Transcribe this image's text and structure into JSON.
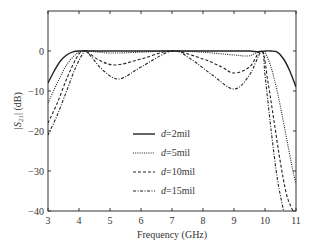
{
  "chart_data": {
    "type": "line",
    "title": "",
    "xlabel": "Frequency (GHz)",
    "ylabel": "|S21| (dB)",
    "xlim": [
      3,
      11
    ],
    "ylim": [
      -40,
      10
    ],
    "xticks": [
      3,
      4,
      5,
      6,
      7,
      8,
      9,
      10,
      11
    ],
    "yticks": [
      0,
      -10,
      -20,
      -30,
      -40
    ],
    "grid": false,
    "legend_position": "center-right inside",
    "series": [
      {
        "name": "d=2mil",
        "style": "solid",
        "x": [
          3.0,
          3.2,
          3.4,
          3.6,
          3.8,
          4.0,
          4.5,
          5,
          6,
          7,
          8,
          9,
          9.5,
          9.8,
          10.0,
          10.2,
          10.4,
          10.6,
          10.8,
          11.0
        ],
        "y": [
          -8,
          -5,
          -2.5,
          -1,
          -0.2,
          0,
          0,
          0,
          0,
          0,
          0,
          0,
          0,
          -0.2,
          0,
          0,
          -0.3,
          -2,
          -5,
          -9
        ]
      },
      {
        "name": "d=5mil",
        "style": "dotted",
        "x": [
          3.0,
          3.3,
          3.6,
          3.9,
          4.1,
          4.3,
          5,
          6,
          7,
          8,
          9,
          9.5,
          9.9,
          10.1,
          10.3,
          10.5,
          10.7,
          10.9,
          11.0
        ],
        "y": [
          -13,
          -8,
          -3.5,
          -0.8,
          0,
          0,
          -0.5,
          -0.3,
          0,
          -0.3,
          -1,
          -1.2,
          0,
          -2,
          -7,
          -14,
          -22,
          -30,
          -33
        ]
      },
      {
        "name": "d=10mil",
        "style": "dashed",
        "x": [
          3.0,
          3.3,
          3.6,
          3.9,
          4.1,
          4.3,
          4.7,
          5.2,
          6,
          7,
          8,
          8.6,
          9.0,
          9.5,
          9.9,
          10.1,
          10.3,
          10.5,
          10.7,
          10.9
        ],
        "y": [
          -18,
          -13,
          -7,
          -2,
          0,
          -0.5,
          -2.5,
          -3.5,
          -2,
          0,
          -2,
          -4,
          -5.5,
          -4,
          0,
          -8,
          -18,
          -28,
          -36,
          -40
        ]
      },
      {
        "name": "d=15mil",
        "style": "dash-dot",
        "x": [
          3.0,
          3.3,
          3.6,
          3.9,
          4.2,
          4.4,
          4.8,
          5.3,
          6,
          7,
          7.6,
          8.3,
          9.0,
          9.5,
          9.9,
          10.0,
          10.2,
          10.4,
          10.6
        ],
        "y": [
          -21,
          -16,
          -10,
          -4,
          0,
          -1.5,
          -5,
          -7,
          -4,
          0,
          -2,
          -6,
          -9.5,
          -6,
          0,
          -6,
          -20,
          -32,
          -40
        ]
      }
    ]
  },
  "labels": {
    "xlabel": "Frequency (GHz)",
    "ylabel_main": "|S",
    "ylabel_sub": "21",
    "ylabel_tail": "| (dB)",
    "xticks": [
      "3",
      "4",
      "5",
      "6",
      "7",
      "8",
      "9",
      "10",
      "11"
    ],
    "yticks": [
      "0",
      "−10",
      "−20",
      "−30",
      "−40"
    ],
    "legend": [
      {
        "var": "d",
        "value": "=2mil"
      },
      {
        "var": "d",
        "value": "=5mil"
      },
      {
        "var": "d",
        "value": "=10mil"
      },
      {
        "var": "d",
        "value": "=15mil"
      }
    ]
  }
}
